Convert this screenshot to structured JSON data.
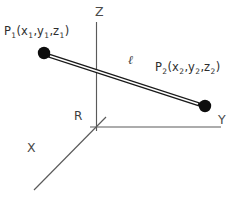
{
  "figure": {
    "name": "3d-line-segment-diagram",
    "background_color": "#ffffff",
    "axis_color": "#5a5a5a",
    "segment_color": "#1a1a1a",
    "dot_color": "#0d0d0d",
    "text_color": "#3a3a3a"
  },
  "axes": {
    "z_label": "Z",
    "y_label": "Y",
    "x_label": "X",
    "origin_label": "R"
  },
  "points": {
    "p1": {
      "name": "P",
      "index": "1",
      "coords": [
        "x",
        "y",
        "z"
      ],
      "coord_index": "1",
      "full_label": "P1(x1,y1,z1)"
    },
    "p2": {
      "name": "P",
      "index": "2",
      "coords": [
        "x",
        "y",
        "z"
      ],
      "coord_index": "2",
      "full_label": "P2(x2,y2,z2)"
    }
  },
  "segment": {
    "label": "ℓ",
    "description": "line-segment-between-p1-and-p2"
  }
}
